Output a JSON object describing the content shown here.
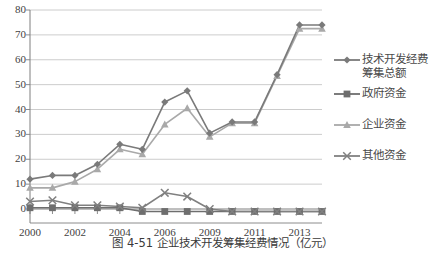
{
  "chart_data": {
    "type": "line",
    "title": "",
    "xlabel": "",
    "ylabel": "",
    "ylim": [
      0,
      80
    ],
    "ytick_step": 10,
    "yticks": [
      "80",
      "70",
      "60",
      "50",
      "40",
      "30",
      "20",
      "10",
      "0"
    ],
    "grid": true,
    "legend_position": "right",
    "x": [
      2000,
      2001,
      2002,
      2003,
      2004,
      2005,
      2006,
      2007,
      2008,
      2009,
      2010,
      2011,
      2012,
      2013
    ],
    "xtick_labels": [
      "2000",
      "",
      "2002",
      "",
      "2004",
      "",
      "2006",
      "",
      "2009",
      "",
      "2011",
      "",
      "2013",
      ""
    ],
    "xtick_labels_visible": [
      "2000",
      "2002",
      "2004",
      "2006",
      "2009",
      "2011",
      "2013"
    ],
    "series": [
      {
        "name": "技术开发经费筹集总额",
        "legend_label": "技术开发经费\n筹集总额",
        "marker": "diamond",
        "color": "#7a7a7a",
        "values": [
          12.0,
          13.5,
          13.5,
          18.0,
          26.0,
          24.0,
          43.0,
          47.5,
          30.5,
          35.0,
          35.0,
          54.0,
          74.0,
          74.0
        ]
      },
      {
        "name": "政府资金",
        "legend_label": "政府资金",
        "marker": "square",
        "color": "#6e6e6e",
        "values": [
          0.5,
          0.5,
          0.5,
          0.5,
          0.5,
          -1.0,
          -1.0,
          -1.0,
          -1.0,
          -1.0,
          -1.0,
          -1.0,
          -1.0,
          -1.0
        ]
      },
      {
        "name": "企业资金",
        "legend_label": "企业资金",
        "marker": "triangle",
        "color": "#a9a9a9",
        "values": [
          8.5,
          8.5,
          11.0,
          16.0,
          24.0,
          22.0,
          34.0,
          40.5,
          29.0,
          34.5,
          34.5,
          53.5,
          72.5,
          72.5
        ]
      },
      {
        "name": "其他资金",
        "legend_label": "其他资金",
        "marker": "x",
        "color": "#808080",
        "values": [
          3.0,
          3.5,
          1.5,
          1.5,
          1.0,
          0.5,
          6.5,
          5.0,
          0.0,
          -1.0,
          -1.0,
          -1.0,
          -1.0,
          -1.0
        ]
      }
    ]
  },
  "caption": {
    "text": "图 4-51  企业技术开发筹集经费情况（亿元）"
  },
  "colors": {
    "axis": "#7f7f7f",
    "grid": "#bfbfbf",
    "text": "#3f3f3f",
    "background": "#ffffff"
  }
}
